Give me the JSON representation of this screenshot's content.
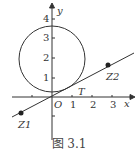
{
  "figure": {
    "caption": "图 3.1",
    "axes": {
      "x_label": "x",
      "y_label": "y",
      "origin_label": "O",
      "x_ticks": [
        "1",
        "2",
        "3"
      ],
      "y_ticks": [
        "1",
        "2",
        "3",
        "4"
      ]
    },
    "points": {
      "z1": "Z1",
      "z2": "Z2",
      "t": "T"
    },
    "circle": {
      "center": [
        0,
        2
      ],
      "radius": 1.7
    },
    "line": {
      "slope": 0.5,
      "through": [
        0,
        0
      ]
    }
  }
}
